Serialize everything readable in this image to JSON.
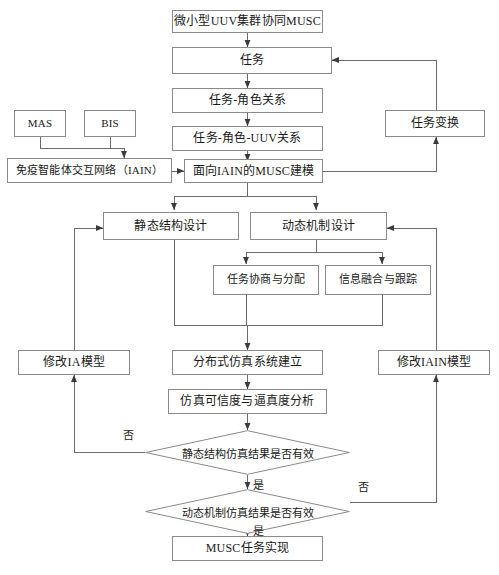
{
  "diagram": {
    "type": "flowchart",
    "title_node": "微小型UUV集群协同MUSC",
    "colors": {
      "box_border": "#8a8a8a",
      "line": "#6b6b6b",
      "text": "#1a1a1a",
      "background": "#ffffff"
    },
    "nodes": {
      "musc_title": "微小型UUV集群协同MUSC",
      "task": "任务",
      "task_role": "任务-角色关系",
      "task_role_uuv": "任务-角色-UUV关系",
      "iain_musc_model": "面向IAIN的MUSC建模",
      "mas": "MAS",
      "bis": "BIS",
      "iain": "免疫智能体交互网络（IAIN）",
      "task_transform": "任务变换",
      "static_structure_design": "静态结构设计",
      "dynamic_mechanism_design": "动态机制设计",
      "task_negotiation": "任务协商与分配",
      "info_fusion": "信息融合与跟踪",
      "modify_ia": "修改IA模型",
      "modify_iain": "修改IAIN模型",
      "distributed_sim": "分布式仿真系统建立",
      "sim_credibility": "仿真可信度与逼真度分析",
      "decision_static": "静态结构仿真结果是否有效",
      "decision_dynamic": "动态机制仿真结果是否有效",
      "musc_task_realize": "MUSC任务实现"
    },
    "edge_labels": {
      "no_static": "否",
      "yes_static": "是",
      "no_dynamic": "否",
      "yes_dynamic": "是"
    }
  }
}
